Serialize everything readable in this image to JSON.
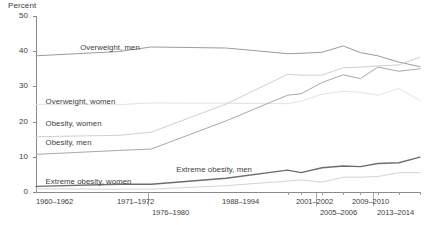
{
  "chart_data": {
    "type": "line",
    "title": "",
    "xlabel": "",
    "ylabel": "Percent",
    "ylim": [
      0,
      50
    ],
    "yticks": [
      0,
      10,
      20,
      30,
      40,
      50
    ],
    "grid": false,
    "legend_position": "inline-labels",
    "x": [
      "1960-1962",
      "1971-1974",
      "1976-1980",
      "1988-1994",
      "1999-2000",
      "2001-2002",
      "2003-2004",
      "2005-2006",
      "2007-2008",
      "2009-2010",
      "2011-2012",
      "2013-2014"
    ],
    "x_tick_labels": [
      "1960–1962",
      "1971–1972",
      "1976–1980",
      "1988–1994",
      "2001–2002",
      "2005–2006",
      "2009–2010",
      "2013–2014"
    ],
    "series": [
      {
        "name": "Overweight, men",
        "color": "#9b9b9b",
        "width": 1.0,
        "values": [
          38.7,
          39.9,
          41.2,
          40.9,
          39.3,
          39.4,
          39.7,
          41.5,
          39.6,
          38.7,
          36.9,
          35.6
        ]
      },
      {
        "name": "Overweight, women",
        "color": "#e2e2e2",
        "width": 1.0,
        "values": [
          24.9,
          24.8,
          25.3,
          25.2,
          25.1,
          25.8,
          27.8,
          28.6,
          28.3,
          27.5,
          29.4,
          26.0
        ]
      },
      {
        "name": "Obesity, women",
        "color": "#cfcfcf",
        "width": 1.0,
        "values": [
          15.7,
          16.1,
          17.0,
          25.0,
          33.4,
          33.2,
          33.2,
          35.3,
          35.5,
          35.8,
          36.1,
          38.3
        ]
      },
      {
        "name": "Obesity, men",
        "color": "#a9a9a9",
        "width": 1.0,
        "values": [
          10.7,
          11.8,
          12.2,
          20.2,
          27.5,
          27.9,
          31.1,
          33.3,
          32.2,
          35.5,
          34.3,
          35.0
        ]
      },
      {
        "name": "Extreme obesity, men",
        "color": "#d4d4d4",
        "width": 1.0,
        "values": [
          0.9,
          0.8,
          0.8,
          1.8,
          3.1,
          3.4,
          2.8,
          4.2,
          4.2,
          4.4,
          5.5,
          5.5
        ]
      },
      {
        "name": "Extreme obesity, women",
        "color": "#6e6e6e",
        "width": 1.4,
        "values": [
          1.6,
          2.2,
          2.2,
          3.9,
          6.2,
          5.5,
          6.9,
          7.4,
          7.2,
          8.1,
          8.3,
          9.9
        ]
      }
    ],
    "inline_labels": [
      {
        "text": "Overweight, men",
        "x_pct": 11.5,
        "y_pct": 15.5
      },
      {
        "text": "Overweight, women",
        "x_pct": 2.5,
        "y_pct": 46.0
      },
      {
        "text": "Obesity, women",
        "x_pct": 2.5,
        "y_pct": 58.5
      },
      {
        "text": "Obesity, men",
        "x_pct": 2.5,
        "y_pct": 69.5
      },
      {
        "text": "Extreme obesity, men",
        "x_pct": 36.5,
        "y_pct": 84.5
      },
      {
        "text": "Extreme obesity, women",
        "x_pct": 2.5,
        "y_pct": 91.5
      }
    ]
  },
  "axis": {
    "unit_label": "Percent",
    "y_labels": [
      "50",
      "40",
      "30",
      "20",
      "10",
      "0"
    ]
  },
  "x_axis_labels": [
    {
      "text": "1960–1962",
      "left": 36,
      "top": 197,
      "align": "start"
    },
    {
      "text": "1971–1972",
      "left": 117,
      "top": 197,
      "align": "start"
    },
    {
      "text": "1976–1980",
      "left": 152,
      "top": 208,
      "align": "start"
    },
    {
      "text": "1988–1994",
      "left": 222,
      "top": 197,
      "align": "start"
    },
    {
      "text": "2001–2002",
      "left": 296,
      "top": 197,
      "align": "start"
    },
    {
      "text": "2005–2006",
      "left": 320,
      "top": 208,
      "align": "start"
    },
    {
      "text": "2009–2010",
      "left": 352,
      "top": 197,
      "align": "start"
    },
    {
      "text": "2013–2014",
      "left": 377,
      "top": 208,
      "align": "start"
    }
  ]
}
